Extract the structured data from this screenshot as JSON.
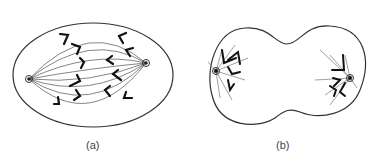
{
  "panels": [
    {
      "id": "a",
      "label": "(a)",
      "description": "cell with spindle, chromosomes aligned between two poles"
    },
    {
      "id": "b",
      "label": "(b)",
      "description": "constricting cell with chromosomes clustered at each pole"
    }
  ],
  "colors": {
    "line": "#333333",
    "background": "#ffffff"
  }
}
